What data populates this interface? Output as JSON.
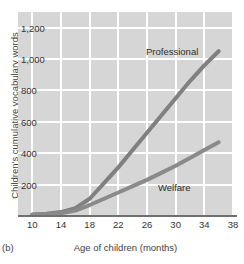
{
  "panel_label": "(b)",
  "top_fragment": "",
  "colors": {
    "plot_background": "#d6d6d6",
    "gridline": "#ffffff",
    "axis_line": "#6f6f6f",
    "professional_line": "#808080",
    "welfare_line": "#8a8a8a",
    "text": "#333333"
  },
  "chart_data": {
    "type": "line",
    "title": "",
    "xlabel": "Age of children (months)",
    "ylabel": "Children's cumulative vocabulary words",
    "xlim": [
      8,
      38
    ],
    "ylim": [
      0,
      1300
    ],
    "xticks": [
      10,
      14,
      18,
      22,
      26,
      30,
      34,
      38
    ],
    "xtick_labels": [
      "10",
      "14",
      "18",
      "22",
      "26",
      "30",
      "34",
      "38"
    ],
    "yticks": [
      200,
      400,
      600,
      800,
      1000,
      1200
    ],
    "ytick_labels": [
      "200",
      "400",
      "600",
      "800",
      "1,000",
      "1,200"
    ],
    "grid": true,
    "legend": "inline-annotations",
    "x": [
      10,
      12,
      14,
      16,
      18,
      20,
      22,
      24,
      26,
      28,
      30,
      32,
      34,
      36
    ],
    "series": [
      {
        "name": "Professional",
        "label_position": "upper-right",
        "values": [
          10,
          15,
          25,
          50,
          110,
          210,
          310,
          420,
          530,
          640,
          750,
          860,
          960,
          1050
        ]
      },
      {
        "name": "Welfare",
        "label_position": "lower-right",
        "values": [
          8,
          12,
          18,
          35,
          70,
          110,
          150,
          190,
          230,
          275,
          320,
          370,
          420,
          470
        ]
      }
    ]
  }
}
